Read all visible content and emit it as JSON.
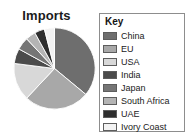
{
  "chart_data": {
    "type": "pie",
    "title": "Imports",
    "legend_title": "Key",
    "legend_position": "right",
    "xlabel": "",
    "ylabel": "",
    "categories": [
      "China",
      "EU",
      "USA",
      "India",
      "Japan",
      "South Africa",
      "UAE",
      "Ivory Coast"
    ],
    "values": [
      36,
      26,
      15,
      6,
      5,
      4,
      4,
      4
    ],
    "units": "percent",
    "colors": [
      "#6e6e6e",
      "#a8a8a8",
      "#d8d8d8",
      "#4b4b4b",
      "#757575",
      "#b4b4b4",
      "#2e2e2e",
      "#f2f2f2"
    ],
    "slices": [
      {
        "label": "China",
        "value": 36,
        "color": "#6e6e6e"
      },
      {
        "label": "EU",
        "value": 26,
        "color": "#a8a8a8"
      },
      {
        "label": "USA",
        "value": 15,
        "color": "#d8d8d8"
      },
      {
        "label": "India",
        "value": 6,
        "color": "#4b4b4b"
      },
      {
        "label": "Japan",
        "value": 5,
        "color": "#757575"
      },
      {
        "label": "South Africa",
        "value": 4,
        "color": "#b4b4b4"
      },
      {
        "label": "UAE",
        "value": 4,
        "color": "#2e2e2e"
      },
      {
        "label": "Ivory Coast",
        "value": 4,
        "color": "#f2f2f2"
      }
    ]
  },
  "legend": {
    "title": "Key",
    "items": [
      {
        "label": "China",
        "color": "#6e6e6e"
      },
      {
        "label": "EU",
        "color": "#a8a8a8"
      },
      {
        "label": "USA",
        "color": "#d8d8d8"
      },
      {
        "label": "India",
        "color": "#4b4b4b"
      },
      {
        "label": "Japan",
        "color": "#757575"
      },
      {
        "label": "South Africa",
        "color": "#b4b4b4"
      },
      {
        "label": "UAE",
        "color": "#2e2e2e"
      },
      {
        "label": "Ivory Coast",
        "color": "#f2f2f2"
      }
    ]
  },
  "style": {
    "background": "#ffffff",
    "legend_border": "#8d8d8d",
    "slice_border": "#ffffff",
    "text_color": "#1b1b1b"
  }
}
